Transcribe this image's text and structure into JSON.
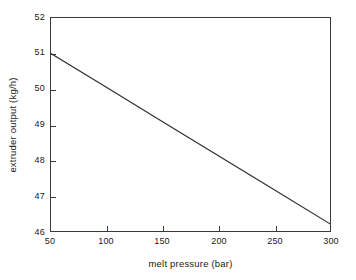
{
  "chart_data": {
    "type": "line",
    "title": "",
    "subtitle": "",
    "xlabel": "melt pressure (bar)",
    "ylabel": "extruder output (kg/h)",
    "xlim": [
      50,
      300
    ],
    "ylim": [
      46,
      52
    ],
    "xticks": [
      50,
      100,
      150,
      200,
      250,
      300
    ],
    "yticks": [
      46,
      47,
      48,
      49,
      50,
      51,
      52
    ],
    "xtick_labels": [
      "50",
      "100",
      "150",
      "200",
      "250",
      "300"
    ],
    "ytick_labels": [
      "46",
      "47",
      "48",
      "49",
      "50",
      "51",
      "52"
    ],
    "grid": false,
    "legend": null,
    "legend_position": "none",
    "annotations": [],
    "series": [
      {
        "name": "extruder output",
        "color": "#2b2b2b",
        "line_width": 1,
        "marker": "none",
        "x": [
          50,
          100,
          150,
          200,
          250,
          300
        ],
        "y": [
          51.0,
          50.04,
          49.08,
          48.12,
          47.16,
          46.2
        ]
      }
    ]
  },
  "axes": {
    "frame_color": "#3a3a3a",
    "background": "#ffffff",
    "tick_direction": "in"
  }
}
